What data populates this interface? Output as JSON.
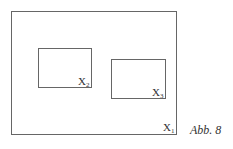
{
  "caption": "Abb. 8",
  "boxes": [
    {
      "id": "X1",
      "base": "X",
      "sub": "1"
    },
    {
      "id": "X2",
      "base": "X",
      "sub": "2"
    },
    {
      "id": "X3",
      "base": "X",
      "sub": "3"
    }
  ]
}
